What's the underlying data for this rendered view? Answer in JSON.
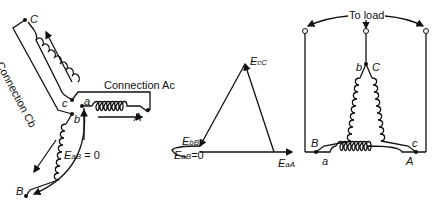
{
  "figure": {
    "left_panel": {
      "connection_cb_label": "Connection Cb",
      "connection_ac_label": "Connection Ac",
      "terminals": {
        "C": "C",
        "c": "c",
        "a": "a",
        "A": "A",
        "b": "b",
        "B": "B"
      },
      "emf_label_main": "E",
      "emf_label_sub": "aB",
      "emf_label_tail": " = 0"
    },
    "middle_panel": {
      "vertex_top": {
        "main": "E",
        "sub": "cC"
      },
      "vertex_left": {
        "main": "E",
        "sub": "bB"
      },
      "vertex_right": {
        "main": "E",
        "sub": "aA"
      },
      "zero_label": {
        "main": "E",
        "sub": "aB",
        "tail": "=0"
      }
    },
    "right_panel": {
      "to_load_label": "To load",
      "terminals": {
        "b": "b",
        "C": "C",
        "B": "B",
        "c": "c",
        "a": "a",
        "A": "A"
      }
    }
  }
}
